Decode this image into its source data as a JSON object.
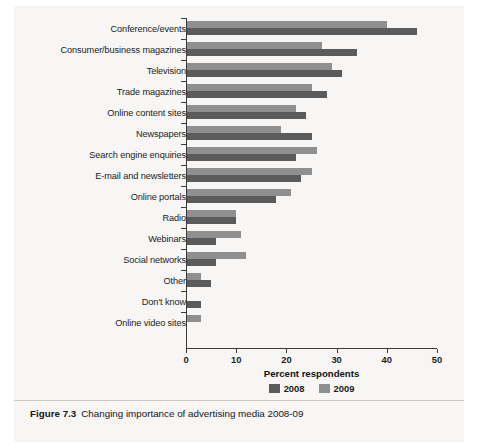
{
  "caption": {
    "label": "Figure 7.3",
    "text": "Changing importance of advertising media 2008-09"
  },
  "chart_data": {
    "type": "bar",
    "orientation": "horizontal",
    "title": "",
    "xlabel": "Percent respondents",
    "ylabel": "",
    "xlim": [
      0,
      50
    ],
    "xticks": [
      0,
      10,
      20,
      30,
      40,
      50
    ],
    "grid": false,
    "legend_position": "bottom",
    "colors": {
      "2008": "#5b5b5b",
      "2009": "#8f8f8f"
    },
    "categories": [
      "Conference/events",
      "Consumer/business magazines",
      "Television",
      "Trade magazines",
      "Online content sites",
      "Newspapers",
      "Search engine enquiries",
      "E-mail and newsletters",
      "Online portals",
      "Radio",
      "Webinars",
      "Social networks",
      "Other",
      "Don't know",
      "Online video sites"
    ],
    "series": [
      {
        "name": "2008",
        "color": "#5b5b5b",
        "values": [
          46,
          34,
          31,
          28,
          24,
          25,
          22,
          23,
          18,
          10,
          6,
          6,
          5,
          3,
          0
        ]
      },
      {
        "name": "2009",
        "color": "#8f8f8f",
        "values": [
          40,
          27,
          29,
          25,
          22,
          19,
          26,
          25,
          21,
          10,
          11,
          12,
          3,
          0,
          3
        ]
      }
    ]
  }
}
